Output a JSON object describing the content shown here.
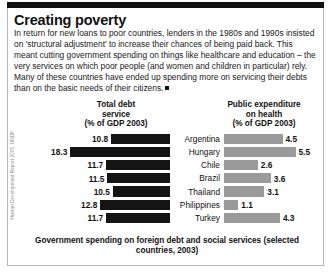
{
  "article": {
    "title": "Creating poverty",
    "body": "In return for new loans to poor countries, lenders in the 1980s and 1990s insisted on 'structural adjustment' to increase their chances of being paid back. This meant cutting government spending on things like healthcare and education – the very services on which poor people (and women and children in particular) rely. Many of these countries have ended up spending more on servicing their debts than on the basic needs of their citizens."
  },
  "source_credit": "Human Development Report 2005, UNDP",
  "caption": "Government spending on foreign debt and social services (selected countries, 2003)",
  "colors": {
    "debt_bar": "#141414",
    "health_bar": "#9a9a9a",
    "rule": "#111111",
    "border": "#b8b8b8"
  },
  "chart_data": {
    "type": "bar",
    "title": "Government spending on foreign debt and social services (selected countries, 2003)",
    "orientation": "horizontal",
    "layout": "diverging-paired (debt grows left, health grows right)",
    "grid": false,
    "legend": "column headers",
    "categories": [
      "Argentina",
      "Hungary",
      "Chile",
      "Brazil",
      "Thailand",
      "Philippines",
      "Turkey"
    ],
    "series": [
      {
        "name": "Total debt service",
        "label": "Total debt\nservice\n(% of GDP 2003)",
        "unit": "% of GDP",
        "year": 2003,
        "color": "#141414",
        "values": [
          10.8,
          18.3,
          11.7,
          11.5,
          10.5,
          12.8,
          11.7
        ]
      },
      {
        "name": "Public expenditure on health",
        "label": "Public expenditure\non health\n(% of GDP 2003)",
        "unit": "% of GDP",
        "year": 2003,
        "color": "#9a9a9a",
        "values": [
          4.5,
          5.5,
          2.6,
          3.6,
          3.1,
          1.1,
          4.3
        ]
      }
    ],
    "xlabel": "",
    "ylabel": "",
    "xlim": [
      0,
      18.3
    ]
  },
  "headers": {
    "left_line1": "Total debt",
    "left_line2": "service",
    "left_line3": "(% of GDP 2003)",
    "right_line1": "Public expenditure",
    "right_line2": "on health",
    "right_line3": "(% of GDP 2003)"
  }
}
